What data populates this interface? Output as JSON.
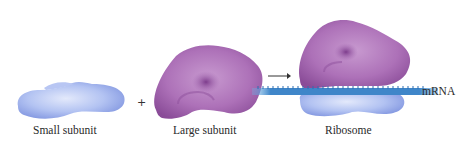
{
  "diagram": {
    "components": [
      {
        "id": "small-subunit",
        "label": "Small subunit",
        "color": "#9fb2ee"
      },
      {
        "id": "large-subunit",
        "label": "Large subunit",
        "color": "#a565b0"
      },
      {
        "id": "ribosome",
        "label": "Ribosome"
      }
    ],
    "operators": {
      "plus": "+",
      "arrow": "→"
    },
    "mrna": {
      "label": "mRNA",
      "color": "#3f86c9"
    }
  }
}
